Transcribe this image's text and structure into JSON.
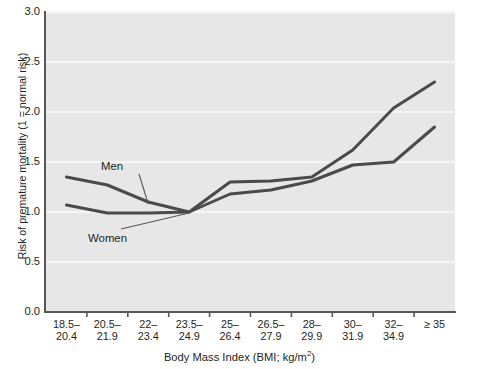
{
  "chart_data": {
    "type": "line",
    "title": "",
    "xlabel": "Body Mass Index (BMI; kg/m2)",
    "ylabel": "Risk of premature mortality (1 = normal risk)",
    "categories": [
      "18.5–20.4",
      "20.5–21.9",
      "22–23.4",
      "23.5–24.9",
      "25–26.4",
      "26.5–27.9",
      "28–29.9",
      "30–31.9",
      "32–34.9",
      "≥ 35"
    ],
    "category_lines": [
      [
        "18.5–",
        "20.4"
      ],
      [
        "20.5–",
        "21.9"
      ],
      [
        "22–",
        "23.4"
      ],
      [
        "23.5–",
        "24.9"
      ],
      [
        "25–",
        "26.4"
      ],
      [
        "26.5–",
        "27.9"
      ],
      [
        "28–",
        "29.9"
      ],
      [
        "30–",
        "31.9"
      ],
      [
        "32–",
        "34.9"
      ],
      [
        "≥ 35",
        ""
      ]
    ],
    "ylim": [
      0.0,
      3.0
    ],
    "ytick_labels": [
      "0.0",
      "0.5",
      "1.0",
      "1.5",
      "2.0",
      "2.5",
      "3.0"
    ],
    "ytick_values": [
      0.0,
      0.5,
      1.0,
      1.5,
      2.0,
      2.5,
      3.0
    ],
    "grid": "horizontal",
    "legend_position": "inline-annotation",
    "series": [
      {
        "name": "Men",
        "color": "#4a4a4d",
        "values": [
          1.35,
          1.27,
          1.1,
          1.0,
          1.3,
          1.31,
          1.35,
          1.62,
          2.04,
          2.3
        ]
      },
      {
        "name": "Women",
        "color": "#4a4a4d",
        "values": [
          1.07,
          0.99,
          0.99,
          1.0,
          1.18,
          1.22,
          1.31,
          1.47,
          1.5,
          1.85
        ]
      }
    ],
    "annotations": [
      {
        "text": "Men",
        "series": "Men",
        "anchor_index": 2
      },
      {
        "text": "Women",
        "series": "Women",
        "anchor_index": 3
      }
    ]
  },
  "style": {
    "plot_background": "#e7e7e7",
    "page_background": "#ffffff",
    "axis_color": "#58585b",
    "grid_color": "#f5f5f5",
    "line_color": "#4a4a4d",
    "text_color": "#231f20"
  }
}
